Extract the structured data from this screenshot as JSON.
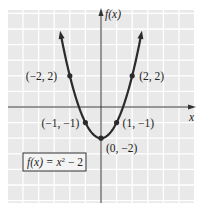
{
  "chart_data": {
    "type": "line",
    "title": "",
    "function_label": "f(x) = x² − 2",
    "function_label_parts": {
      "lhs": "f(x) = x",
      "exp": "2",
      "rhs": " − 2"
    },
    "xlabel": "x",
    "ylabel": "f(x)",
    "xlim": [
      -6,
      6
    ],
    "ylim": [
      -6,
      6
    ],
    "grid": true,
    "legend": "none",
    "series": [
      {
        "name": "f(x) = x^2 - 2",
        "x": [
          -2.6,
          -2,
          -1,
          0,
          1,
          2,
          2.6
        ],
        "values": [
          4.76,
          2,
          -1,
          -2,
          -1,
          2,
          4.76
        ]
      }
    ],
    "labeled_points": [
      {
        "x": -2,
        "y": 2,
        "label": "(−2, 2)"
      },
      {
        "x": 2,
        "y": 2,
        "label": "(2, 2)"
      },
      {
        "x": -1,
        "y": -1,
        "label": "(−1, −1)"
      },
      {
        "x": 1,
        "y": -1,
        "label": "(1, −1)"
      },
      {
        "x": 0,
        "y": -2,
        "label": "(0, −2)"
      }
    ]
  },
  "colors": {
    "grid_bg": "#e9e9e9",
    "grid_line": "#ffffff",
    "curve": "#2b2b2b",
    "axis": "#333333"
  }
}
